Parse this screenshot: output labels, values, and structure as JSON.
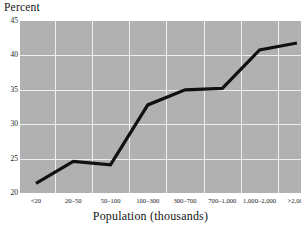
{
  "chart_data": {
    "type": "line",
    "title": "",
    "ylabel": "Percent",
    "xlabel": "Population (thousands)",
    "categories": [
      "<20",
      "20–50",
      "50–100",
      "100–300",
      "300–700",
      "700–1,000",
      "1,000–2,000",
      ">2,000"
    ],
    "values": [
      21.4,
      24.6,
      24.1,
      32.8,
      35.0,
      35.2,
      40.8,
      41.8
    ],
    "series": [
      {
        "name": "Percent",
        "values": [
          21.4,
          24.6,
          24.1,
          32.8,
          35.0,
          35.2,
          40.8,
          41.8
        ]
      }
    ],
    "ylim": [
      20,
      45
    ],
    "yticks": [
      20,
      25,
      30,
      35,
      40,
      45
    ],
    "ytick_labels": [
      "20",
      "25",
      "30",
      "35",
      "40",
      "45"
    ],
    "grid": true,
    "legend": "none",
    "line_color": "#111111",
    "plot_background": "#b4b4b4",
    "gridline_color": "#efefef"
  },
  "axes": {
    "y_title": "Percent",
    "x_title": "Population (thousands)"
  }
}
